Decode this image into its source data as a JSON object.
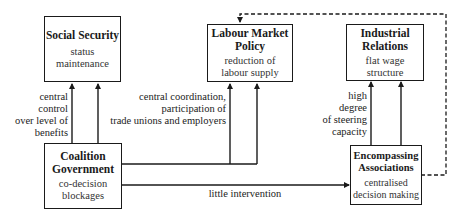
{
  "diagram": {
    "nodes": {
      "social_security": {
        "title": "Social Security",
        "subtitle": [
          "status",
          "maintenance"
        ]
      },
      "labour_market_policy": {
        "title": [
          "Labour Market",
          "Policy"
        ],
        "subtitle": [
          "reduction of",
          "labour supply"
        ]
      },
      "industrial_relations": {
        "title": [
          "Industrial",
          "Relations"
        ],
        "subtitle": [
          "flat wage",
          "structure"
        ]
      },
      "coalition_government": {
        "title": [
          "Coalition",
          "Government"
        ],
        "subtitle": [
          "co-decision",
          "blockages"
        ]
      },
      "encompassing_associations": {
        "title": [
          "Encompassing",
          "Associations"
        ],
        "subtitle": [
          "centralised",
          "decision making"
        ]
      }
    },
    "edge_labels": {
      "coalition_to_social_security": [
        "central",
        "control",
        "over level of",
        "benefits"
      ],
      "coalition_to_labour_market": [
        "central coordination,",
        "participation of",
        "trade unions and employers"
      ],
      "coalition_to_encompassing": "little intervention",
      "encompassing_to_industrial": [
        "high",
        "degree",
        "of steering",
        "capacity"
      ]
    },
    "edges": [
      {
        "from": "coalition_government",
        "to": "social_security",
        "style": "solid"
      },
      {
        "from": "coalition_government",
        "to": "labour_market_policy",
        "style": "solid"
      },
      {
        "from": "coalition_government",
        "to": "encompassing_associations",
        "style": "solid"
      },
      {
        "from": "encompassing_associations",
        "to": "industrial_relations",
        "style": "solid"
      },
      {
        "from": "encompassing_associations",
        "to": "labour_market_policy",
        "style": "dashed"
      }
    ]
  }
}
